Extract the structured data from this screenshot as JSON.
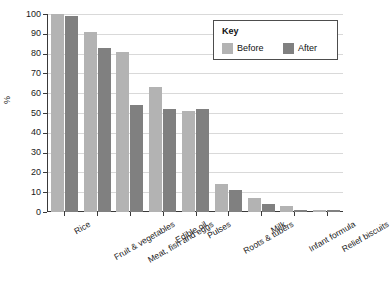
{
  "chart_data": {
    "type": "bar",
    "title": "",
    "xlabel": "",
    "ylabel": "%",
    "ylim": [
      0,
      100
    ],
    "yticks": [
      0,
      10,
      20,
      30,
      40,
      50,
      60,
      70,
      80,
      90,
      100
    ],
    "grid": true,
    "legend_position": "top-right",
    "legend_title": "Key",
    "categories": [
      "Rice",
      "Fruit & vegetables",
      "Meat, fish and eggs",
      "Edible oil",
      "Pulses",
      "Roots & tubers",
      "Milk",
      "Infant formula",
      "Relief biscuits"
    ],
    "series": [
      {
        "name": "Before",
        "color": "#b3b3b3",
        "values": [
          100,
          91,
          81,
          63,
          51,
          14,
          7,
          3,
          1
        ]
      },
      {
        "name": "After",
        "color": "#808080",
        "values": [
          99,
          83,
          54,
          52,
          52,
          11,
          4,
          1,
          1
        ]
      }
    ]
  },
  "axis": {
    "y_title": "%"
  },
  "colors": {
    "before": "#b3b3b3",
    "after": "#808080",
    "axis": "#3a3a3a",
    "grid": "#d9d9d9",
    "text": "#1a1a1a",
    "legend_border": "#4d4d4d"
  }
}
